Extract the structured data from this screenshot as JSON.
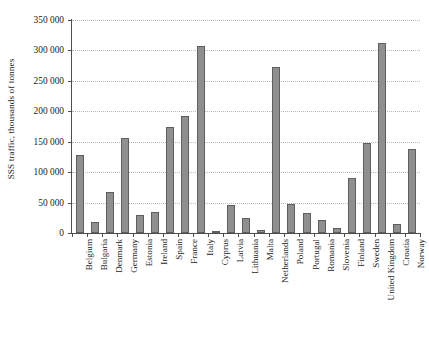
{
  "chart_data": {
    "type": "bar",
    "title": "",
    "xlabel": "",
    "ylabel": "SSS traffic, thousands of tonnes",
    "ylim": [
      0,
      350000
    ],
    "grid": true,
    "legend": "none",
    "y_ticks": [
      0,
      50000,
      100000,
      150000,
      200000,
      250000,
      300000,
      350000
    ],
    "y_tick_labels": [
      "0",
      "50 000",
      "100 000",
      "150 000",
      "200 000",
      "250 000",
      "300 000",
      "350 000"
    ],
    "categories": [
      "Belgium",
      "Bulgaria",
      "Denmark",
      "Germany",
      "Estonia",
      "Ireland",
      "Spain",
      "France",
      "Italy",
      "Cyprus",
      "Latvia",
      "Lithuania",
      "Malta",
      "Netherlands",
      "Poland",
      "Portugal",
      "Romania",
      "Slovenia",
      "Finland",
      "Sweden",
      "United Kingdom",
      "Croatia",
      "Norway"
    ],
    "values": [
      128000,
      18000,
      67000,
      156000,
      30000,
      35000,
      175000,
      192000,
      308000,
      2500,
      46000,
      25000,
      5000,
      272000,
      47000,
      33000,
      21000,
      8000,
      90000,
      148000,
      313000,
      14000,
      138000
    ],
    "bar_color": "#8f8f8f",
    "bar_edge_color": "#5e5e5e",
    "grid_color": "#b9b9b9",
    "axis_color": "#4d4d4d",
    "background": "#ffffff"
  }
}
